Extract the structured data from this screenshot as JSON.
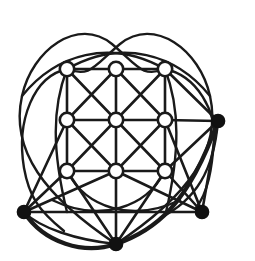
{
  "figure": {
    "kind": "diagram",
    "background_color": "#ffffff",
    "stroke_color": "#1a1a1a",
    "solid_node_color": "#111111",
    "hollow_node_fill": "#ffffff",
    "canvas": {
      "width": 255,
      "height": 261
    },
    "line_widths": {
      "grid_edge": 2.6,
      "arc_thin": 2.4,
      "arc_bold": 4.2,
      "node_stroke": 2.6
    },
    "counts": {
      "hollow_nodes": 9,
      "solid_nodes": 4,
      "total_nodes": 13
    }
  },
  "nodes": {
    "grid": [
      {
        "id": "g00",
        "label": "grid-node-top-left",
        "x": 67,
        "y": 69,
        "type": "hollow",
        "r": 7.2
      },
      {
        "id": "g10",
        "label": "grid-node-top-center",
        "x": 116,
        "y": 69,
        "type": "hollow",
        "r": 7.2
      },
      {
        "id": "g20",
        "label": "grid-node-top-right",
        "x": 165,
        "y": 69,
        "type": "hollow",
        "r": 7.2
      },
      {
        "id": "g01",
        "label": "grid-node-mid-left",
        "x": 67,
        "y": 120,
        "type": "hollow",
        "r": 7.2
      },
      {
        "id": "g11",
        "label": "grid-node-center",
        "x": 116,
        "y": 120,
        "type": "hollow",
        "r": 7.2
      },
      {
        "id": "g21",
        "label": "grid-node-mid-right",
        "x": 165,
        "y": 120,
        "type": "hollow",
        "r": 7.2
      },
      {
        "id": "g02",
        "label": "grid-node-bottom-left",
        "x": 67,
        "y": 171,
        "type": "hollow",
        "r": 7.2
      },
      {
        "id": "g12",
        "label": "grid-node-bottom-center",
        "x": 116,
        "y": 171,
        "type": "hollow",
        "r": 7.2
      },
      {
        "id": "g22",
        "label": "grid-node-bottom-right",
        "x": 165,
        "y": 171,
        "type": "hollow",
        "r": 7.2
      }
    ],
    "outer": [
      {
        "id": "oR",
        "label": "outer-node-right",
        "x": 218,
        "y": 121,
        "type": "solid",
        "r": 6.6
      },
      {
        "id": "oL",
        "label": "outer-node-left-bottom",
        "x": 24,
        "y": 212,
        "type": "solid",
        "r": 6.6
      },
      {
        "id": "oBR",
        "label": "outer-node-bottom-right",
        "x": 202,
        "y": 212,
        "type": "solid",
        "r": 6.6
      },
      {
        "id": "oB",
        "label": "outer-node-bottom-center",
        "x": 116,
        "y": 244,
        "type": "solid",
        "r": 6.6
      }
    ]
  },
  "edges": {
    "horizontal": [
      {
        "from": "g00",
        "to": "g10"
      },
      {
        "from": "g10",
        "to": "g20"
      },
      {
        "from": "g01",
        "to": "g11"
      },
      {
        "from": "g11",
        "to": "g21"
      },
      {
        "from": "g02",
        "to": "g12"
      },
      {
        "from": "g12",
        "to": "g22"
      }
    ],
    "vertical": [
      {
        "from": "g00",
        "to": "g01"
      },
      {
        "from": "g01",
        "to": "g02"
      },
      {
        "from": "g10",
        "to": "g11"
      },
      {
        "from": "g11",
        "to": "g12"
      },
      {
        "from": "g20",
        "to": "g21"
      },
      {
        "from": "g21",
        "to": "g22"
      }
    ],
    "diagonal_down": [
      {
        "from": "g00",
        "to": "g11"
      },
      {
        "from": "g10",
        "to": "g21"
      },
      {
        "from": "g01",
        "to": "g12"
      },
      {
        "from": "g11",
        "to": "g22"
      }
    ],
    "diagonal_up": [
      {
        "from": "g10",
        "to": "g01"
      },
      {
        "from": "g20",
        "to": "g11"
      },
      {
        "from": "g11",
        "to": "g02"
      },
      {
        "from": "g21",
        "to": "g12"
      }
    ],
    "outer_straight": [
      {
        "from": "g21",
        "to": "oR"
      },
      {
        "from": "g20",
        "to": "oR"
      },
      {
        "from": "g22",
        "to": "oR"
      },
      {
        "from": "g02",
        "to": "oL"
      },
      {
        "from": "g01",
        "to": "oL"
      },
      {
        "from": "g12",
        "to": "oL"
      },
      {
        "from": "g22",
        "to": "oBR"
      },
      {
        "from": "g12",
        "to": "oBR"
      },
      {
        "from": "g21",
        "to": "oBR"
      },
      {
        "from": "g02",
        "to": "oB"
      },
      {
        "from": "g12",
        "to": "oB"
      },
      {
        "from": "g22",
        "to": "oB"
      },
      {
        "from": "oL",
        "to": "oBR"
      },
      {
        "from": "oR",
        "to": "oBR"
      }
    ]
  },
  "arcs": [
    {
      "name": "heart-loop-left",
      "d": "M 116 244 C 44 196 10 150 22 96 C 32 50 78 16 112 44 C 138 66 142 78 165 69",
      "weight": "thin"
    },
    {
      "name": "heart-loop-right",
      "d": "M 116 244 C 188 196 222 150 210 96 C 200 50 154 16 120 44 C 94 66 90 78 67 69",
      "weight": "thin"
    },
    {
      "name": "outer-envelope-left",
      "d": "M 67 69 C 34 76 16 120 24 168 C 29 196 38 210 64 231",
      "weight": "thin"
    },
    {
      "name": "outer-envelope-right",
      "d": "M 165 69 C 198 76 216 112 214 140 C 212 170 208 192 196 208",
      "weight": "thin"
    },
    {
      "name": "bold-outer-rim",
      "d": "M 24 212 C 44 243 84 255 116 244 C 154 231 188 206 218 121",
      "weight": "bold"
    },
    {
      "name": "arc-left-vertical",
      "d": "M 67 69 C 52 108 52 150 67 212",
      "weight": "thin"
    },
    {
      "name": "arc-right-vertical",
      "d": "M 165 69 C 180 108 180 152 166 212",
      "weight": "thin"
    },
    {
      "name": "arc-inner-belly-left",
      "d": "M 67 171 C 86 208 132 223 180 200",
      "weight": "thin"
    },
    {
      "name": "arc-inner-belly-right",
      "d": "M 165 171 C 146 208 100 223 52 200",
      "weight": "thin"
    },
    {
      "name": "arc-top-crossing-left",
      "d": "M 22 96 C 56 54 110 38 165 69",
      "weight": "thin"
    },
    {
      "name": "arc-top-crossing-right",
      "d": "M 210 96 C 176 54 122 38 67 69",
      "weight": "thin"
    },
    {
      "name": "arc-right-sweep-low",
      "d": "M 218 121 C 214 170 196 200 160 218",
      "weight": "thin"
    },
    {
      "name": "arc-left-sweep-low",
      "d": "M 24 212 C 40 228 76 240 116 244",
      "weight": "thin"
    }
  ]
}
